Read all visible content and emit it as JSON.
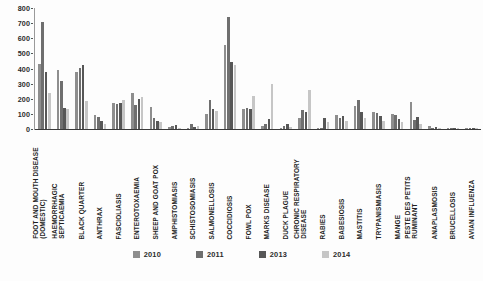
{
  "chart_data": {
    "type": "bar",
    "title": "",
    "xlabel": "",
    "ylabel": "",
    "ylim": [
      0,
      800
    ],
    "yticks": [
      0,
      100,
      200,
      300,
      400,
      500,
      600,
      700,
      800
    ],
    "grid": false,
    "legend_position": "bottom",
    "categories": [
      "FOOT AND MOUTH DISEASE (DOMESTIC)",
      "HAEMORRHAGIC SEPTICAEMIA",
      "BLACK QUARTER",
      "ANTHRAX",
      "FASCIOLIASIS",
      "ENTEROTOXAEMIA",
      "SHEEP AND GOAT POX",
      "AMPHISTOMIASIS",
      "SCHISTOSOMIASIS",
      "SALMONELLOSIS",
      "COCCIDIOSIS",
      "FOWL POX",
      "MARKS DISEASE",
      "DUCK PLAGUE",
      "CHRONIC RESPIRATORY DISEASE",
      "RABIES",
      "BABESIOSIS",
      "MASTITIS",
      "TRYPANISMIASIS",
      "MANGE",
      "PESTE DES PETITS RUMINANT",
      "ANAPLASMOSIS",
      "BRUCELLOSIS",
      "AVIAN INFLUENZA"
    ],
    "categories_lines": [
      [
        "FOOT AND MOUTH DISEASE",
        "(DOMESTIC)"
      ],
      [
        "HAEMORRHAGIC",
        "SEPTICAEMIA"
      ],
      [
        "BLACK QUARTER",
        ""
      ],
      [
        "ANTHRAX",
        ""
      ],
      [
        "FASCIOLIASIS",
        ""
      ],
      [
        "ENTEROTOXAEMIA",
        ""
      ],
      [
        "SHEEP AND GOAT POX",
        ""
      ],
      [
        "AMPHISTOMIASIS",
        ""
      ],
      [
        "SCHISTOSOMIASIS",
        ""
      ],
      [
        "SALMONELLOSIS",
        ""
      ],
      [
        "COCCIDIOSIS",
        ""
      ],
      [
        "FOWL POX",
        ""
      ],
      [
        "MARKS DISEASE",
        ""
      ],
      [
        "DUCK PLAGUE",
        ""
      ],
      [
        "CHRONIC RESPIRATORY",
        "DISEASE"
      ],
      [
        "RABIES",
        ""
      ],
      [
        "BABESIOSIS",
        ""
      ],
      [
        "MASTITIS",
        ""
      ],
      [
        "TRYPANISMIASIS",
        ""
      ],
      [
        "MANGE",
        ""
      ],
      [
        "PESTE DES PETITS",
        "RUMINANT"
      ],
      [
        "ANAPLASMOSIS",
        ""
      ],
      [
        "BRUCELLOSIS",
        ""
      ],
      [
        "AVIAN INFLUENZA",
        ""
      ]
    ],
    "series": [
      {
        "name": "2010",
        "color": "#8e8e8e",
        "values": [
          430,
          390,
          375,
          90,
          175,
          235,
          145,
          15,
          10,
          100,
          555,
          130,
          20,
          10,
          75,
          5,
          95,
          150,
          115,
          100,
          180,
          20,
          5,
          3
        ]
      },
      {
        "name": "2011",
        "color": "#6f6f6f",
        "values": [
          705,
          320,
          405,
          80,
          165,
          160,
          70,
          20,
          30,
          190,
          740,
          140,
          30,
          20,
          125,
          10,
          75,
          190,
          105,
          95,
          60,
          10,
          4,
          2
        ]
      },
      {
        "name": "2013",
        "color": "#575757",
        "values": [
          380,
          140,
          420,
          55,
          170,
          200,
          55,
          25,
          15,
          130,
          440,
          135,
          65,
          30,
          110,
          70,
          85,
          115,
          85,
          65,
          80,
          12,
          3,
          2
        ]
      },
      {
        "name": "2014",
        "color": "#c6c6c6",
        "values": [
          240,
          135,
          185,
          30,
          195,
          210,
          45,
          10,
          20,
          120,
          425,
          215,
          300,
          15,
          255,
          45,
          55,
          75,
          50,
          45,
          30,
          8,
          2,
          1
        ]
      }
    ]
  },
  "legend": {
    "items": [
      {
        "label": "2010",
        "color": "#8e8e8e"
      },
      {
        "label": "2011",
        "color": "#6f6f6f"
      },
      {
        "label": "2013",
        "color": "#575757"
      },
      {
        "label": "2014",
        "color": "#c6c6c6"
      }
    ]
  },
  "axis": {
    "y_tick_labels": [
      "800",
      "700",
      "600",
      "500",
      "400",
      "300",
      "200",
      "100",
      "0"
    ]
  }
}
